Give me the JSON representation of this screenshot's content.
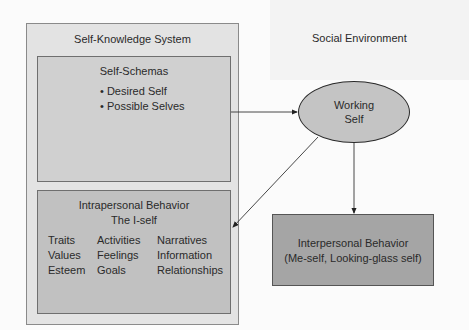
{
  "diagram": {
    "social_environment": {
      "label": "Social Environment"
    },
    "self_knowledge_system": {
      "title": "Self-Knowledge System",
      "self_schemas": {
        "title": "Self-Schemas",
        "bullets": [
          "Desired Self",
          "Possible Selves"
        ]
      },
      "intrapersonal": {
        "title": "Intrapersonal Behavior",
        "subtitle": "The I-self",
        "columns": [
          [
            "Traits",
            "Values",
            "Esteem"
          ],
          [
            "Activities",
            "Feelings",
            "Goals"
          ],
          [
            "Narratives",
            "Information",
            "Relationships"
          ]
        ]
      }
    },
    "working_self": {
      "line1": "Working",
      "line2": "Self"
    },
    "interpersonal": {
      "title": "Interpersonal Behavior",
      "subtitle": "(Me-self, Looking-glass self)"
    },
    "edges": [
      {
        "from": "Self-Schemas",
        "to": "Working Self"
      },
      {
        "from": "Working Self",
        "to": "Intrapersonal Behavior"
      },
      {
        "from": "Working Self",
        "to": "Interpersonal Behavior"
      }
    ],
    "bullet_glyph": "•",
    "colors": {
      "outer_fill": "#e3e3e3",
      "schemas_fill": "#d0d0d0",
      "intrapersonal_fill": "#c1c1c1",
      "ellipse_fill": "#c4c4c4",
      "interpersonal_fill": "#a5a5a5"
    }
  }
}
